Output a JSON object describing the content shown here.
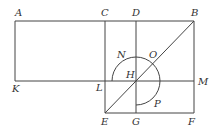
{
  "diagram": {
    "type": "geometric-construction",
    "points": {
      "A": {
        "label": "A"
      },
      "C": {
        "label": "C"
      },
      "D": {
        "label": "D"
      },
      "B": {
        "label": "B"
      },
      "K": {
        "label": "K"
      },
      "L": {
        "label": "L"
      },
      "H": {
        "label": "H"
      },
      "M": {
        "label": "M"
      },
      "E": {
        "label": "E"
      },
      "G": {
        "label": "G"
      },
      "F": {
        "label": "F"
      },
      "N": {
        "label": "N"
      },
      "O": {
        "label": "O"
      },
      "P": {
        "label": "P"
      }
    },
    "segments": [
      "AB",
      "AK",
      "KM",
      "CE",
      "DG",
      "BF",
      "EF",
      "EB"
    ],
    "arcs": [
      "NOP centered at H"
    ]
  }
}
